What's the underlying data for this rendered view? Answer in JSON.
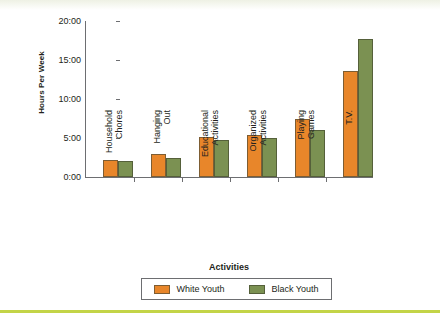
{
  "theme": {
    "orange": "#e8862a",
    "green": "#7b9152",
    "rule": "#c3d447",
    "axis": "#6d6e71",
    "text": "#231f20"
  },
  "chart_data": {
    "type": "bar",
    "title": "",
    "xlabel": "Activities",
    "ylabel": "Hours Per Week",
    "categories": [
      "Household Chores",
      "Hanging Out",
      "Educational Activities",
      "Organized Activities",
      "Playing Games",
      "T.V."
    ],
    "category_lines": [
      [
        "Household",
        "Chores"
      ],
      [
        "Hanging",
        "Out"
      ],
      [
        "Educational",
        "Activities"
      ],
      [
        "Organized",
        "Activities"
      ],
      [
        "Playing",
        "Games"
      ],
      [
        "T.V.",
        ""
      ]
    ],
    "series": [
      {
        "name": "White Youth",
        "color": "#e8862a",
        "values": [
          2.2,
          3.0,
          5.1,
          5.4,
          7.4,
          13.6
        ]
      },
      {
        "name": "Black Youth",
        "color": "#7b9152",
        "values": [
          2.0,
          2.4,
          4.7,
          5.0,
          6.0,
          17.7
        ]
      }
    ],
    "ylim": [
      0,
      20
    ],
    "ytick_values": [
      20,
      15,
      10,
      5,
      0
    ],
    "ytick_labels": [
      "20:00",
      "15:00",
      "10:00",
      "5:00",
      "0:00"
    ],
    "grid": false,
    "legend_position": "bottom"
  }
}
